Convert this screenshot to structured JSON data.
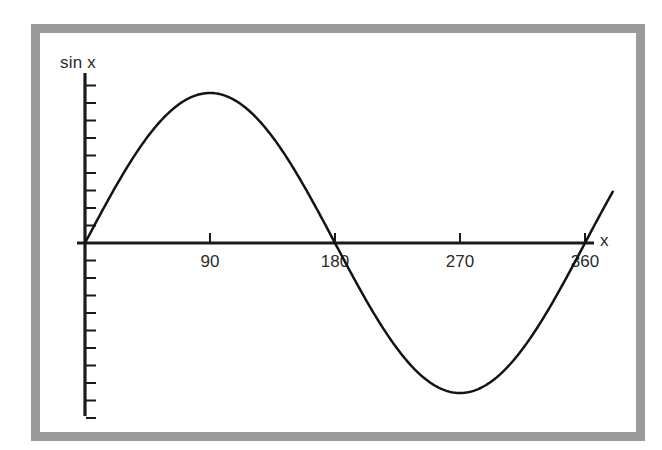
{
  "figure": {
    "kind": "line-plot",
    "frame_color": "#9b9b9b",
    "background_color": "#ffffff",
    "curve_color": "#141414",
    "axis_color": "#1a1a1a"
  },
  "axes": {
    "y_axis_label": "sin x",
    "x_axis_label": "x"
  },
  "chart_data": {
    "type": "line",
    "title": "",
    "subtitle": "",
    "xlabel": "x",
    "ylabel": "sin x",
    "legend": [],
    "legend_position": "none",
    "grid": false,
    "xlim": [
      0,
      390
    ],
    "ylim": [
      -1.25,
      1.25
    ],
    "x_ticks": [
      90,
      180,
      270,
      360
    ],
    "x_tick_labels": [
      "90",
      "180",
      "270",
      "360"
    ],
    "y_ticks": [],
    "y_tick_labels": [],
    "y_minor_tick_count_above_axis": 9,
    "y_minor_tick_count_below_axis": 10,
    "series": [
      {
        "name": "sin x",
        "color": "#141414",
        "x": [
          0,
          10,
          20,
          30,
          40,
          50,
          60,
          70,
          80,
          90,
          100,
          110,
          120,
          130,
          140,
          150,
          160,
          170,
          180,
          190,
          200,
          210,
          220,
          230,
          240,
          250,
          260,
          270,
          280,
          290,
          300,
          310,
          320,
          330,
          340,
          350,
          360,
          370,
          380
        ],
        "y": [
          0,
          0.174,
          0.342,
          0.5,
          0.643,
          0.766,
          0.866,
          0.94,
          0.985,
          1,
          0.985,
          0.94,
          0.866,
          0.766,
          0.643,
          0.5,
          0.342,
          0.174,
          0,
          -0.174,
          -0.342,
          -0.5,
          -0.643,
          -0.766,
          -0.866,
          -0.94,
          -0.985,
          -1,
          -0.985,
          -0.94,
          -0.866,
          -0.766,
          -0.643,
          -0.5,
          -0.342,
          -0.174,
          0,
          0.174,
          0.342
        ]
      }
    ],
    "annotations": [
      {
        "text": "sin x",
        "role": "y-axis-label"
      },
      {
        "text": "x",
        "role": "x-axis-label"
      }
    ]
  }
}
